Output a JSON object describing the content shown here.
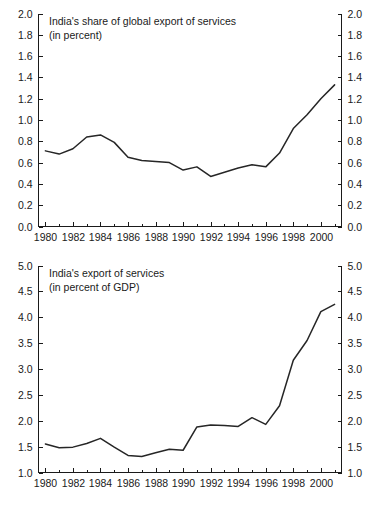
{
  "figure": {
    "background": "#ffffff",
    "line_color": "#262626",
    "axis_color": "#1a1a1a",
    "panel_count": 2
  },
  "chart_data": [
    {
      "id": "share-of-global-export-of-services",
      "type": "line",
      "title": "India's share of global export of services",
      "subtitle": "(in percent)",
      "xlabel": "",
      "ylabel": "",
      "xlim": [
        1979.5,
        2001.5
      ],
      "ylim": [
        0.0,
        2.0
      ],
      "grid": false,
      "legend": "none",
      "y_ticks": [
        "0.0",
        "0.2",
        "0.4",
        "0.6",
        "0.8",
        "1.0",
        "1.2",
        "1.4",
        "1.6",
        "1.8",
        "2.0"
      ],
      "y_tick_values": [
        0.0,
        0.2,
        0.4,
        0.6,
        0.8,
        1.0,
        1.2,
        1.4,
        1.6,
        1.8,
        2.0
      ],
      "y_axis_right_mirrored": true,
      "x_ticks": [
        "1980",
        "1982",
        "1984",
        "1986",
        "1988",
        "1990",
        "1992",
        "1994",
        "1996",
        "1998",
        "2000"
      ],
      "x_tick_values": [
        1980,
        1982,
        1984,
        1986,
        1988,
        1990,
        1992,
        1994,
        1996,
        1998,
        2000
      ],
      "x_minor_ticks": [
        1981,
        1983,
        1985,
        1987,
        1989,
        1991,
        1993,
        1995,
        1997,
        1999,
        2001
      ],
      "x": [
        1980,
        1981,
        1982,
        1983,
        1984,
        1985,
        1986,
        1987,
        1988,
        1989,
        1990,
        1991,
        1992,
        1993,
        1994,
        1995,
        1996,
        1997,
        1998,
        1999,
        2000,
        2001
      ],
      "values": [
        0.71,
        0.68,
        0.73,
        0.84,
        0.86,
        0.79,
        0.65,
        0.62,
        0.61,
        0.6,
        0.53,
        0.56,
        0.47,
        0.51,
        0.55,
        0.58,
        0.56,
        0.69,
        0.92,
        1.05,
        1.2,
        1.33
      ]
    },
    {
      "id": "export-of-services-percent-gdp",
      "type": "line",
      "title": "India's export of services",
      "subtitle": "(in percent of GDP)",
      "xlabel": "",
      "ylabel": "",
      "xlim": [
        1979.5,
        2001.5
      ],
      "ylim": [
        1.0,
        5.0
      ],
      "grid": false,
      "legend": "none",
      "y_ticks": [
        "1.0",
        "1.5",
        "2.0",
        "2.5",
        "3.0",
        "3.5",
        "4.0",
        "4.5",
        "5.0"
      ],
      "y_tick_values": [
        1.0,
        1.5,
        2.0,
        2.5,
        3.0,
        3.5,
        4.0,
        4.5,
        5.0
      ],
      "y_axis_right_mirrored": true,
      "x_ticks": [
        "1980",
        "1982",
        "1984",
        "1986",
        "1988",
        "1990",
        "1992",
        "1994",
        "1996",
        "1998",
        "2000"
      ],
      "x_tick_values": [
        1980,
        1982,
        1984,
        1986,
        1988,
        1990,
        1992,
        1994,
        1996,
        1998,
        2000
      ],
      "x_minor_ticks": [
        1981,
        1983,
        1985,
        1987,
        1989,
        1991,
        1993,
        1995,
        1997,
        1999,
        2001
      ],
      "x": [
        1980,
        1981,
        1982,
        1983,
        1984,
        1985,
        1986,
        1987,
        1988,
        1989,
        1990,
        1991,
        1992,
        1993,
        1994,
        1995,
        1996,
        1997,
        1998,
        1999,
        2000,
        2001
      ],
      "values": [
        1.55,
        1.48,
        1.49,
        1.56,
        1.66,
        1.49,
        1.33,
        1.31,
        1.38,
        1.45,
        1.43,
        1.88,
        1.92,
        1.91,
        1.89,
        2.06,
        1.93,
        2.29,
        3.17,
        3.55,
        4.11,
        4.25
      ]
    }
  ]
}
